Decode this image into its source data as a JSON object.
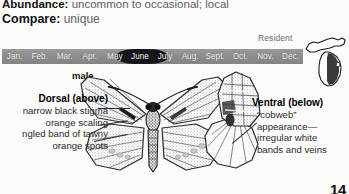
{
  "info": {
    "abundance_label": "Abundance:",
    "abundance_value": "uncommon to occasional; local",
    "compare_label": "Compare:",
    "compare_value": "unique"
  },
  "flight_chart": {
    "resident_label": "Resident",
    "months": [
      "Jan.",
      "Feb.",
      "Mar.",
      "Apr.",
      "May",
      "June",
      "July",
      "Aug.",
      "Sept.",
      "Oct.",
      "Nov.",
      "Dec."
    ],
    "bar_color": "#8d8d8d",
    "month_text_color": "#f2f2f2",
    "flight_color": "#15151a",
    "flight_start_month": "May",
    "flight_peak_month": "June",
    "flight_end_month": "July"
  },
  "range_map": {
    "name": "michigan-range-map",
    "shade_color": "#3a3a3a",
    "outline_color": "#1a1a1a",
    "fill_color": "#ffffff"
  },
  "specimen": {
    "sex_label": "male",
    "dorsal": {
      "heading": "Dorsal (above)",
      "notes": [
        "narrow black stigma",
        "orange scaling",
        "ngled band of tawny",
        "orange spots"
      ]
    },
    "ventral": {
      "heading": "Ventral (below)",
      "notes": [
        "“cobweb”",
        "appearance—",
        "irregular white",
        "bands and veins"
      ]
    }
  },
  "page_number": "14"
}
